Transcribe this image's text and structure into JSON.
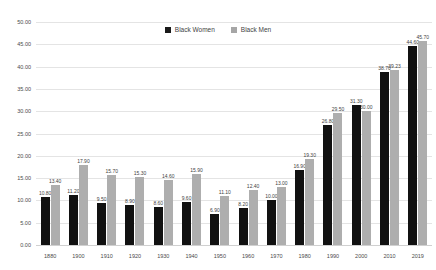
{
  "chart_data": {
    "type": "bar",
    "title": "",
    "subtitle": "",
    "xlabel": "",
    "ylabel": "",
    "ylim": [
      0,
      50
    ],
    "ytick_step": 5,
    "grid": true,
    "legend_position": "top-center",
    "categories": [
      "1880",
      "1900",
      "1910",
      "1920",
      "1930",
      "1940",
      "1950",
      "1960",
      "1970",
      "1980",
      "1990",
      "2000",
      "2010",
      "2019"
    ],
    "yticks": [
      "0.00",
      "5.00",
      "10.00",
      "15.00",
      "20.00",
      "25.00",
      "30.00",
      "35.00",
      "40.00",
      "45.00",
      "50.00"
    ],
    "series": [
      {
        "name": "Black Women",
        "color": "#111111",
        "values": [
          10.8,
          11.2,
          9.5,
          8.9,
          8.6,
          9.6,
          6.9,
          8.2,
          10.0,
          16.9,
          26.8,
          31.3,
          38.7,
          44.6
        ],
        "labels": [
          "10.80",
          "11.20",
          "9.50",
          "8.90",
          "8.60",
          "9.60",
          "6.90",
          "8.20",
          "10.00",
          "16.90",
          "26.80",
          "31.30",
          "38.70",
          "44.60"
        ]
      },
      {
        "name": "Black Men",
        "color": "#aeaeae",
        "values": [
          13.4,
          17.9,
          15.7,
          15.3,
          14.6,
          15.9,
          11.1,
          12.4,
          13.0,
          19.3,
          29.5,
          30.0,
          39.23,
          45.7
        ],
        "labels": [
          "13.40",
          "17.90",
          "15.70",
          "15.30",
          "14.60",
          "15.90",
          "11.10",
          "12.40",
          "13.00",
          "19.30",
          "29.50",
          "30.00",
          "39.23",
          "45.70"
        ]
      }
    ]
  },
  "legend": {
    "items": [
      {
        "label": "Black Women",
        "swatch": "women-swatch"
      },
      {
        "label": "Black Men",
        "swatch": "men-swatch"
      }
    ]
  },
  "colors": {
    "series_women": "#111111",
    "series_men": "#aeaeae",
    "gridline": "#e4e4e4",
    "text": "#3f3f3f",
    "background": "#ffffff"
  }
}
